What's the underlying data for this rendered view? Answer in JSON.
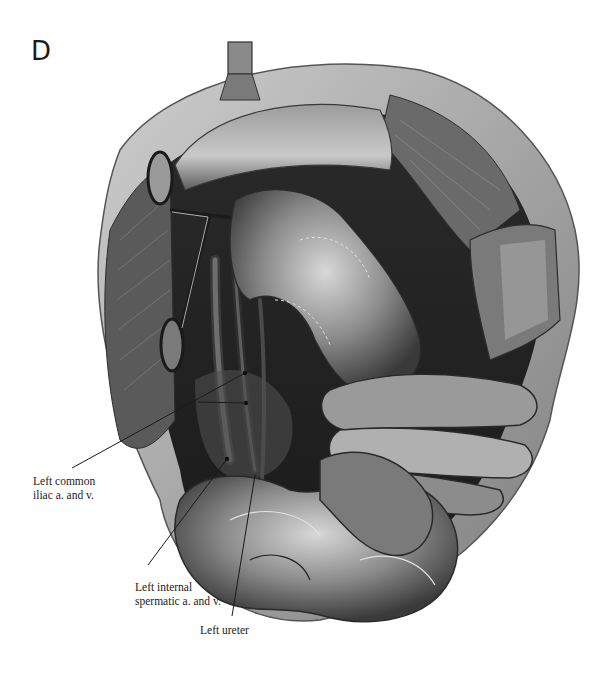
{
  "figure": {
    "panel_letter": "D",
    "palette": {
      "background": "#ffffff",
      "dark": "#1e1e1e",
      "mid": "#6a6a6a",
      "light": "#b8b8b8",
      "highlight": "#e6e6e6"
    }
  },
  "labels": [
    {
      "id": "left-common-iliac",
      "lines": [
        "Left common",
        "iliac a. and v."
      ]
    },
    {
      "id": "left-internal-spermatic",
      "lines": [
        "Left internal",
        "spermatic a. and v."
      ]
    },
    {
      "id": "left-ureter",
      "lines": [
        "Left ureter"
      ]
    }
  ]
}
